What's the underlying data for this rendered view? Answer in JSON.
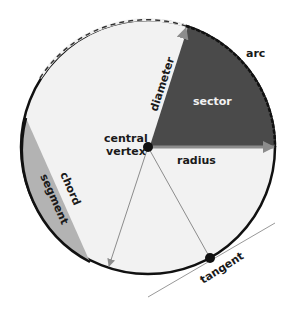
{
  "diagram": {
    "labels": {
      "arc": "arc",
      "sector": "sector",
      "diameter": "diameter",
      "central_vertex_line1": "central",
      "central_vertex_line2": "vertex",
      "radius": "radius",
      "chord": "chord",
      "segment": "segment",
      "tangent": "tangent"
    },
    "colors": {
      "circle_fill": "#f2f2f2",
      "circle_stroke": "#111111",
      "sector_fill": "#4a4a4a",
      "segment_fill": "#b3b3b3",
      "arrow_color": "#8c8c8c",
      "tangent_line": "#999999"
    }
  }
}
